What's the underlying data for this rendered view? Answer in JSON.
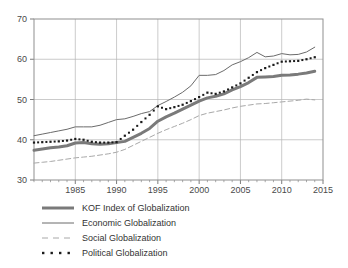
{
  "chart_data": {
    "type": "line",
    "title": "",
    "subtitle": "",
    "xlabel": "",
    "ylabel": "",
    "xlim": [
      1980,
      2015
    ],
    "ylim": [
      30,
      70
    ],
    "grid": true,
    "legend_position": "below",
    "x_ticks": [
      1985,
      1990,
      1995,
      2000,
      2005,
      2010,
      2015
    ],
    "y_ticks": [
      30,
      40,
      50,
      60,
      70
    ],
    "x": [
      1980,
      1981,
      1982,
      1983,
      1984,
      1985,
      1986,
      1987,
      1988,
      1989,
      1990,
      1991,
      1992,
      1993,
      1994,
      1995,
      1996,
      1997,
      1998,
      1999,
      2000,
      2001,
      2002,
      2003,
      2004,
      2005,
      2006,
      2007,
      2008,
      2009,
      2010,
      2011,
      2012,
      2013,
      2014
    ],
    "series": [
      {
        "name": "KOF Index of Globalization",
        "style": "thick-solid",
        "color": "#7a7a7a",
        "values": [
          37.4,
          37.7,
          38.0,
          38.2,
          38.5,
          39.2,
          39.3,
          39.0,
          38.9,
          39.0,
          39.3,
          39.6,
          40.6,
          41.6,
          42.8,
          44.6,
          45.7,
          46.6,
          47.6,
          48.6,
          49.6,
          50.4,
          50.8,
          51.4,
          52.4,
          53.2,
          54.2,
          55.5,
          55.6,
          55.7,
          56.0,
          56.1,
          56.3,
          56.6,
          57.0
        ]
      },
      {
        "name": "Economic Globalization",
        "style": "thin-solid",
        "color": "#6b6b6b",
        "values": [
          41.0,
          41.4,
          41.8,
          42.2,
          42.6,
          43.2,
          43.2,
          43.2,
          43.6,
          44.3,
          45.0,
          45.2,
          45.8,
          46.5,
          47.0,
          48.5,
          49.5,
          50.6,
          51.8,
          53.4,
          56.0,
          56.0,
          56.2,
          57.2,
          58.6,
          59.4,
          60.4,
          61.7,
          60.6,
          60.8,
          61.4,
          61.1,
          61.2,
          61.8,
          63.0
        ]
      },
      {
        "name": "Social Globalization",
        "style": "dashed",
        "color": "#a8a8a8",
        "values": [
          34.2,
          34.4,
          34.6,
          34.9,
          35.2,
          35.5,
          35.7,
          35.9,
          36.2,
          36.5,
          36.9,
          37.6,
          38.6,
          39.6,
          40.6,
          41.6,
          42.5,
          43.3,
          44.1,
          45.0,
          46.0,
          46.6,
          47.0,
          47.4,
          47.9,
          48.3,
          48.6,
          48.9,
          49.0,
          49.2,
          49.4,
          49.6,
          49.8,
          50.1,
          49.9
        ]
      },
      {
        "name": "Political Globalization",
        "style": "dotted",
        "color": "#1a1a1a",
        "values": [
          39.3,
          39.4,
          39.5,
          39.6,
          39.8,
          40.2,
          40.0,
          39.5,
          39.3,
          39.3,
          39.4,
          41.0,
          42.5,
          44.4,
          46.2,
          48.3,
          47.6,
          48.1,
          48.7,
          49.6,
          50.6,
          51.7,
          51.4,
          52.0,
          53.0,
          54.0,
          55.4,
          56.8,
          57.8,
          58.6,
          59.4,
          59.5,
          59.6,
          60.0,
          60.5
        ]
      }
    ],
    "legend": [
      {
        "label": "KOF Index of Globalization",
        "style": "thick-solid",
        "color": "#7a7a7a"
      },
      {
        "label": "Economic Globalization",
        "style": "thin-solid",
        "color": "#6b6b6b"
      },
      {
        "label": "Social Globalization",
        "style": "dashed",
        "color": "#a8a8a8"
      },
      {
        "label": "Political Globalization",
        "style": "dotted",
        "color": "#1a1a1a"
      }
    ]
  },
  "axes": {
    "grid_color": "#b5b5b5",
    "frame_color": "#8f8f8f"
  }
}
